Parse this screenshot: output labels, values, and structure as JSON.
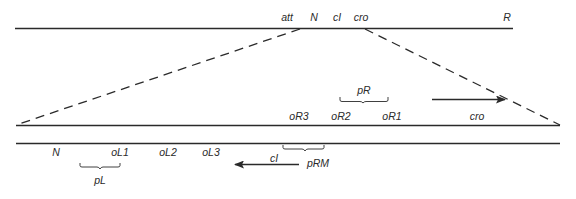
{
  "colors": {
    "line": "#2a2a2a",
    "background": "#ffffff",
    "text": "#2a2a2a"
  },
  "top_line_labels": {
    "att": "att",
    "N": "N",
    "cI": "cI",
    "cro": "cro",
    "R": "R"
  },
  "expanded_upper_labels": {
    "pR": "pR",
    "oR3": "oR3",
    "oR2": "oR2",
    "oR1": "oR1",
    "cro": "cro"
  },
  "expanded_lower_labels": {
    "N": "N",
    "oL1": "oL1",
    "oL2": "oL2",
    "oL3": "oL3",
    "cI": "cI",
    "pRM": "pRM",
    "pL": "pL"
  },
  "arrows": {
    "cro_direction": "right",
    "cI_direction": "left"
  }
}
